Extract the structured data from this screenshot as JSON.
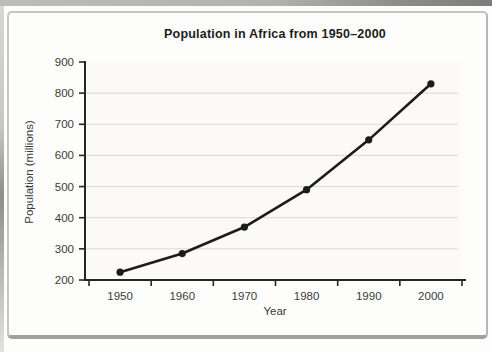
{
  "figure": {
    "frame_color": "#c6c5c2",
    "page_edge_color": "#9a9997"
  },
  "chart_data": {
    "type": "line",
    "title": "Population in Africa from 1950–2000",
    "xlabel": "Year",
    "ylabel": "Population (millions)",
    "categories": [
      "1950",
      "1960",
      "1970",
      "1980",
      "1990",
      "2000"
    ],
    "series": [
      {
        "name": "Population",
        "values": [
          225,
          285,
          370,
          490,
          650,
          830
        ]
      }
    ],
    "ylim": [
      200,
      900
    ],
    "y_ticks": [
      200,
      300,
      400,
      500,
      600,
      700,
      800,
      900
    ],
    "grid": "horizontal, light gray, at 300-800",
    "legend": "none",
    "line_color": "#1c1c1c",
    "marker": "filled-circle",
    "grid_color": "#dbd9d3",
    "axis_color": "#262626",
    "plot_bg_color": "#fbfaf6",
    "tick_label_color": "#3b3b3b"
  }
}
